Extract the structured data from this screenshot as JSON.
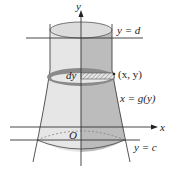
{
  "figure": {
    "type": "solid-of-revolution",
    "axis_of_rotation": "y",
    "labels": {
      "y_axis": "y",
      "x_axis": "x",
      "origin": "O",
      "top_bound": "y = d",
      "bottom_bound": "y = c",
      "curve": "x = g(y)",
      "point": "(x, y)",
      "thickness": "dy"
    },
    "colors": {
      "solid_light": "#e6e6e6",
      "solid_dark": "#b8b8b8",
      "disk_ring": "#8a8a8a",
      "axis": "#222222",
      "hatch": "#9a9a9a"
    }
  }
}
